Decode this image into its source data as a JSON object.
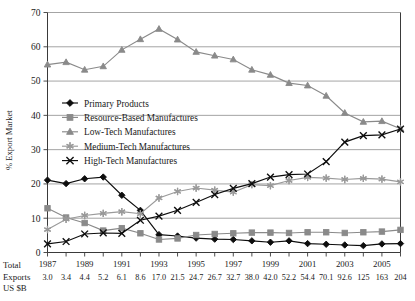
{
  "figure": {
    "background": "#ffffff",
    "axis_color": "#3a3a3a",
    "grid_color": "#8d8d8d"
  },
  "axes": {
    "ylabel": "% Export Market",
    "yticks": [
      "0",
      "10",
      "20",
      "30",
      "40",
      "50",
      "60",
      "70"
    ],
    "xticks_labeled": [
      "1987",
      "1989",
      "1991",
      "1993",
      "1995",
      "1997",
      "1999",
      "2001",
      "2003",
      "2005"
    ]
  },
  "footer": {
    "line1": "Total",
    "line2": "Exports",
    "line3": "US $B"
  },
  "legend": {
    "items": [
      {
        "label": "Primary Products",
        "marker": "diamond",
        "color": "#0d0d0d"
      },
      {
        "label": "Resource-Based Manufactures",
        "marker": "square",
        "color": "#8a8a8a"
      },
      {
        "label": "Low-Tech Manufactures",
        "marker": "triangle",
        "color": "#8a8a8a"
      },
      {
        "label": "Medium-Tech Manufactures",
        "marker": "asterisk",
        "color": "#9a9a9a"
      },
      {
        "label": "High-Tech Manufactures",
        "marker": "cross",
        "color": "#0d0d0d"
      }
    ]
  },
  "chart_data": {
    "type": "line",
    "title": "",
    "xlabel": "",
    "ylabel": "% Export Market",
    "ylim": [
      0,
      70
    ],
    "ytick_step": 10,
    "grid": true,
    "legend_position": "inside-left",
    "categories": [
      "1987",
      "1988",
      "1989",
      "1990",
      "1991",
      "1992",
      "1993",
      "1994",
      "1995",
      "1996",
      "1997",
      "1998",
      "1999",
      "2000",
      "2001",
      "2002",
      "2003",
      "2004",
      "2005",
      "2006"
    ],
    "total_exports_us_bn": [
      "3.0",
      "3.4",
      "4.4",
      "5.2",
      "6.1",
      "8.6",
      "17.0",
      "21.5",
      "24.7",
      "26.7",
      "32.7",
      "38.0",
      "42.0",
      "52.2",
      "54.4",
      "70.1",
      "92.6",
      "125",
      "163",
      "204"
    ],
    "series": [
      {
        "name": "Primary Products",
        "color": "#0d0d0d",
        "marker": "diamond",
        "values": [
          21.1,
          20.1,
          21.5,
          22.0,
          16.7,
          12.3,
          5.2,
          4.8,
          4.2,
          3.9,
          3.8,
          3.4,
          3.0,
          3.4,
          2.6,
          2.4,
          2.2,
          2.0,
          2.5,
          2.6
        ]
      },
      {
        "name": "Resource-Based Manufactures",
        "color": "#8a8a8a",
        "marker": "square",
        "values": [
          12.9,
          10.2,
          8.6,
          6.4,
          7.1,
          5.6,
          3.8,
          4.1,
          5.1,
          5.4,
          5.6,
          5.8,
          5.8,
          5.7,
          5.9,
          5.9,
          5.7,
          5.9,
          6.1,
          6.6
        ]
      },
      {
        "name": "Low-Tech Manufactures",
        "color": "#8a8a8a",
        "marker": "triangle",
        "values": [
          54.8,
          55.5,
          53.3,
          54.3,
          59.1,
          62.2,
          65.2,
          62.1,
          58.5,
          57.4,
          56.3,
          53.3,
          51.8,
          49.4,
          48.7,
          45.7,
          40.7,
          38.1,
          38.3,
          36.1
        ]
      },
      {
        "name": "Medium-Tech Manufactures",
        "color": "#9a9a9a",
        "marker": "asterisk",
        "values": [
          6.7,
          9.7,
          10.8,
          11.4,
          11.9,
          11.3,
          15.9,
          17.8,
          18.8,
          18.2,
          17.6,
          19.8,
          19.5,
          21.0,
          21.9,
          21.7,
          21.3,
          21.6,
          21.4,
          20.6
        ]
      },
      {
        "name": "High-Tech Manufactures",
        "color": "#0d0d0d",
        "marker": "cross",
        "values": [
          2.5,
          3.2,
          5.4,
          5.7,
          5.6,
          9.4,
          10.6,
          12.3,
          14.6,
          16.9,
          18.7,
          20.1,
          22.0,
          22.7,
          22.9,
          26.5,
          32.2,
          34.1,
          34.3,
          36.0
        ]
      }
    ]
  }
}
